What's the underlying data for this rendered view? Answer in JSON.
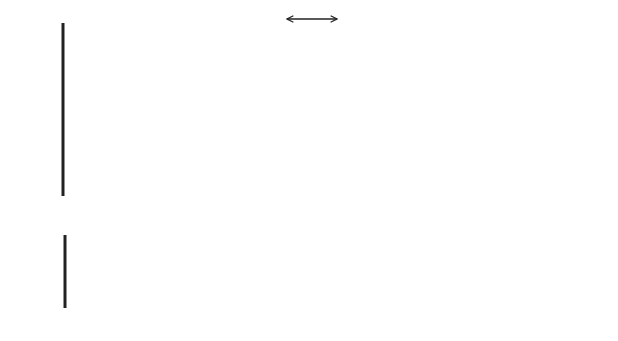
{
  "legend": {
    "label": "time intervals for base scenario",
    "icon": "double-headed-arrow-icon"
  },
  "top_panel": {
    "origin_label": "0",
    "axis_label": "time",
    "timeframes": [
      {
        "name": "TF1",
        "color": "#3a3a3a",
        "arrow_end_x": 133,
        "y": 49,
        "interval": [
          64,
          104
        ]
      },
      {
        "name": "TF2",
        "color": "#aaaaaa",
        "arrow_end_x": 190,
        "y": 78,
        "interval": [
          104,
          152
        ]
      },
      {
        "name": "TF3",
        "color": "#8c8c8c",
        "arrow_end_x": 295,
        "y": 113,
        "interval": [
          152,
          248
        ]
      },
      {
        "name": "TF4",
        "color": "#5e5e5e",
        "arrow_end_x": 428,
        "y": 149,
        "interval": [
          248,
          373
        ]
      },
      {
        "name": "TF5",
        "color": "#4a4a4a",
        "arrow_end_x": 590,
        "y": 187,
        "interval": [
          373,
          590
        ]
      }
    ]
  },
  "bottom_panel": {
    "origin_label": "0",
    "axis_label": "time",
    "segments": [
      {
        "name": "TF1",
        "color": "#3a3a3a",
        "start": 66,
        "end": 106
      },
      {
        "name": "TF2",
        "color": "#aaaaaa",
        "start": 106,
        "end": 154
      },
      {
        "name": "TF3",
        "color": "#8c8c8c",
        "start": 154,
        "end": 249
      },
      {
        "name": "TF4",
        "color": "#6a6a6a",
        "start": 249,
        "end": 374
      },
      {
        "name": "TF5",
        "color": "#555555",
        "start": 374,
        "end": 590
      }
    ]
  },
  "dividers_x": [
    104,
    152,
    249,
    374
  ]
}
